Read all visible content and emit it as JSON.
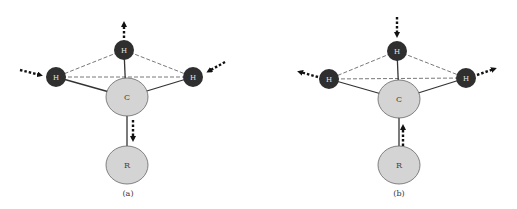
{
  "colors": {
    "hydrogen_fill": "#2f2f2f",
    "hydrogen_text": "#e8e8e8",
    "carbon_fill": "#d4d4d4",
    "carbon_stroke": "#555555",
    "bond": "#333333",
    "dashed": "#555555",
    "arrow": "#111111",
    "label_text": "#444444"
  },
  "panels": [
    {
      "caption": "(a)",
      "atoms": {
        "h_top": "H",
        "h_left": "H",
        "h_right": "H",
        "carbon": "C",
        "group": "R"
      },
      "motion": {
        "h_top": "outward-up",
        "h_left": "inward",
        "h_right": "inward",
        "c_to_r": "toward-R"
      }
    },
    {
      "caption": "(b)",
      "atoms": {
        "h_top": "H",
        "h_left": "H",
        "h_right": "H",
        "carbon": "C",
        "group": "R"
      },
      "motion": {
        "h_top": "inward-down",
        "h_left": "outward",
        "h_right": "outward",
        "r_to_c": "toward-C"
      }
    }
  ]
}
